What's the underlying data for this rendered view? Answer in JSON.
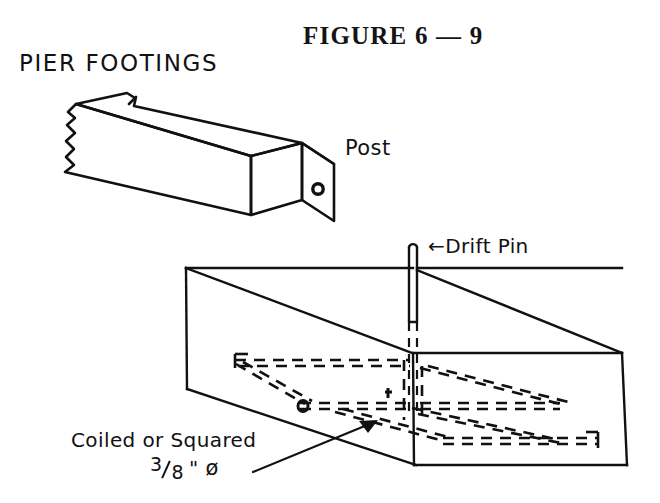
{
  "figure": {
    "title": "FIGURE 6 — 9",
    "heading": "PIER FOOTINGS",
    "background_color": "#ffffff",
    "ink_color": "#111111"
  },
  "labels": {
    "post": "Post",
    "drift_pin": "←Drift Pin",
    "rebar_line1": "Coiled or Squared",
    "rebar_size_numerator": "3",
    "rebar_size_denominator": "8",
    "rebar_size_unit": "\"",
    "rebar_diameter_symbol": "ø"
  },
  "parts": {
    "post": {
      "name": "Post",
      "description": "isometric square timber post with broken end and drilled hole",
      "end_hole": "drift pin hole"
    },
    "pier": {
      "name": "Concrete pier footing",
      "description": "isometric open box showing hidden reinforcement",
      "reinforcement": "Coiled or Squared 3/8\" ø",
      "drift_pin": "Drift Pin"
    }
  }
}
